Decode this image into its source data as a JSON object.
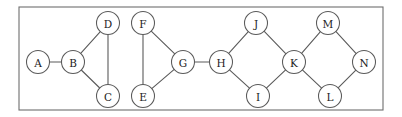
{
  "figure": {
    "type": "undirected-graph",
    "title": "",
    "width": 402,
    "height": 117,
    "background_color": "#ffffff",
    "frame": {
      "x": 19,
      "y": 7,
      "width": 364,
      "height": 103,
      "stroke_color": "#6e6e6e",
      "stroke_width": 1.1
    },
    "node_style": {
      "radius": 11.5,
      "fill_color": "#ffffff",
      "stroke_color": "#5a5a5a",
      "label_color": "#1c1c1c"
    },
    "edge_style": {
      "stroke_color": "#5a5a5a",
      "stroke_width": 1.1
    }
  },
  "graph_data": {
    "nodes": [
      {
        "id": "A",
        "label": "A",
        "x": 38,
        "y": 62
      },
      {
        "id": "B",
        "label": "B",
        "x": 73,
        "y": 62
      },
      {
        "id": "C",
        "label": "C",
        "x": 108,
        "y": 96
      },
      {
        "id": "D",
        "label": "D",
        "x": 108,
        "y": 23
      },
      {
        "id": "E",
        "label": "E",
        "x": 143,
        "y": 96
      },
      {
        "id": "F",
        "label": "F",
        "x": 143,
        "y": 23
      },
      {
        "id": "G",
        "label": "G",
        "x": 183,
        "y": 62
      },
      {
        "id": "H",
        "label": "H",
        "x": 221,
        "y": 62
      },
      {
        "id": "I",
        "label": "I",
        "x": 258,
        "y": 96
      },
      {
        "id": "J",
        "label": "J",
        "x": 256,
        "y": 23
      },
      {
        "id": "K",
        "label": "K",
        "x": 294,
        "y": 62
      },
      {
        "id": "L",
        "label": "L",
        "x": 330,
        "y": 96
      },
      {
        "id": "M",
        "label": "M",
        "x": 328,
        "y": 23
      },
      {
        "id": "N",
        "label": "N",
        "x": 364,
        "y": 62
      }
    ],
    "edges": [
      {
        "source": "A",
        "target": "B"
      },
      {
        "source": "B",
        "target": "D"
      },
      {
        "source": "B",
        "target": "C"
      },
      {
        "source": "D",
        "target": "C"
      },
      {
        "source": "F",
        "target": "E"
      },
      {
        "source": "F",
        "target": "G"
      },
      {
        "source": "E",
        "target": "G"
      },
      {
        "source": "G",
        "target": "H"
      },
      {
        "source": "H",
        "target": "J"
      },
      {
        "source": "H",
        "target": "I"
      },
      {
        "source": "J",
        "target": "K"
      },
      {
        "source": "I",
        "target": "K"
      },
      {
        "source": "K",
        "target": "M"
      },
      {
        "source": "K",
        "target": "L"
      },
      {
        "source": "M",
        "target": "N"
      },
      {
        "source": "L",
        "target": "N"
      }
    ]
  }
}
